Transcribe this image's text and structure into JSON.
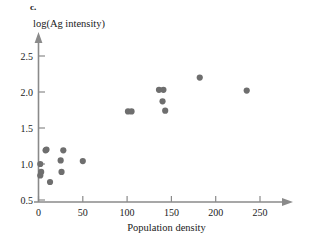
{
  "panel": {
    "label": "c."
  },
  "chart_data": {
    "type": "scatter",
    "title": "",
    "xlabel": "Population density",
    "ylabel": "log(Ag intensity)",
    "xlim": [
      -6,
      272
    ],
    "ylim": [
      0.42,
      2.62
    ],
    "xticks": [
      0,
      50,
      100,
      150,
      200,
      250
    ],
    "xticklabels": [
      "0",
      "50",
      "100",
      "150",
      "200",
      "250"
    ],
    "yticks": [
      0.5,
      1.0,
      1.5,
      2.0,
      2.5
    ],
    "yticklabels": [
      "0.5",
      "1.0",
      "1.5",
      "2.0",
      "2.5"
    ],
    "grid": false,
    "legend": null,
    "marker": "circle",
    "marker_color": "#6e6e6e",
    "marker_size": 3.1,
    "n_points": 18,
    "points": [
      {
        "x": 2,
        "y": 1.0
      },
      {
        "x": 2,
        "y": 0.84
      },
      {
        "x": 3,
        "y": 0.89
      },
      {
        "x": 8,
        "y": 1.19
      },
      {
        "x": 9,
        "y": 1.2
      },
      {
        "x": 13,
        "y": 0.75
      },
      {
        "x": 25,
        "y": 1.05
      },
      {
        "x": 26,
        "y": 0.89
      },
      {
        "x": 28,
        "y": 1.19
      },
      {
        "x": 50,
        "y": 1.04
      },
      {
        "x": 101,
        "y": 1.73
      },
      {
        "x": 105,
        "y": 1.73
      },
      {
        "x": 136,
        "y": 2.03
      },
      {
        "x": 141,
        "y": 2.03
      },
      {
        "x": 140,
        "y": 1.87
      },
      {
        "x": 143,
        "y": 1.74
      },
      {
        "x": 182,
        "y": 2.2
      },
      {
        "x": 235,
        "y": 2.02
      }
    ]
  }
}
